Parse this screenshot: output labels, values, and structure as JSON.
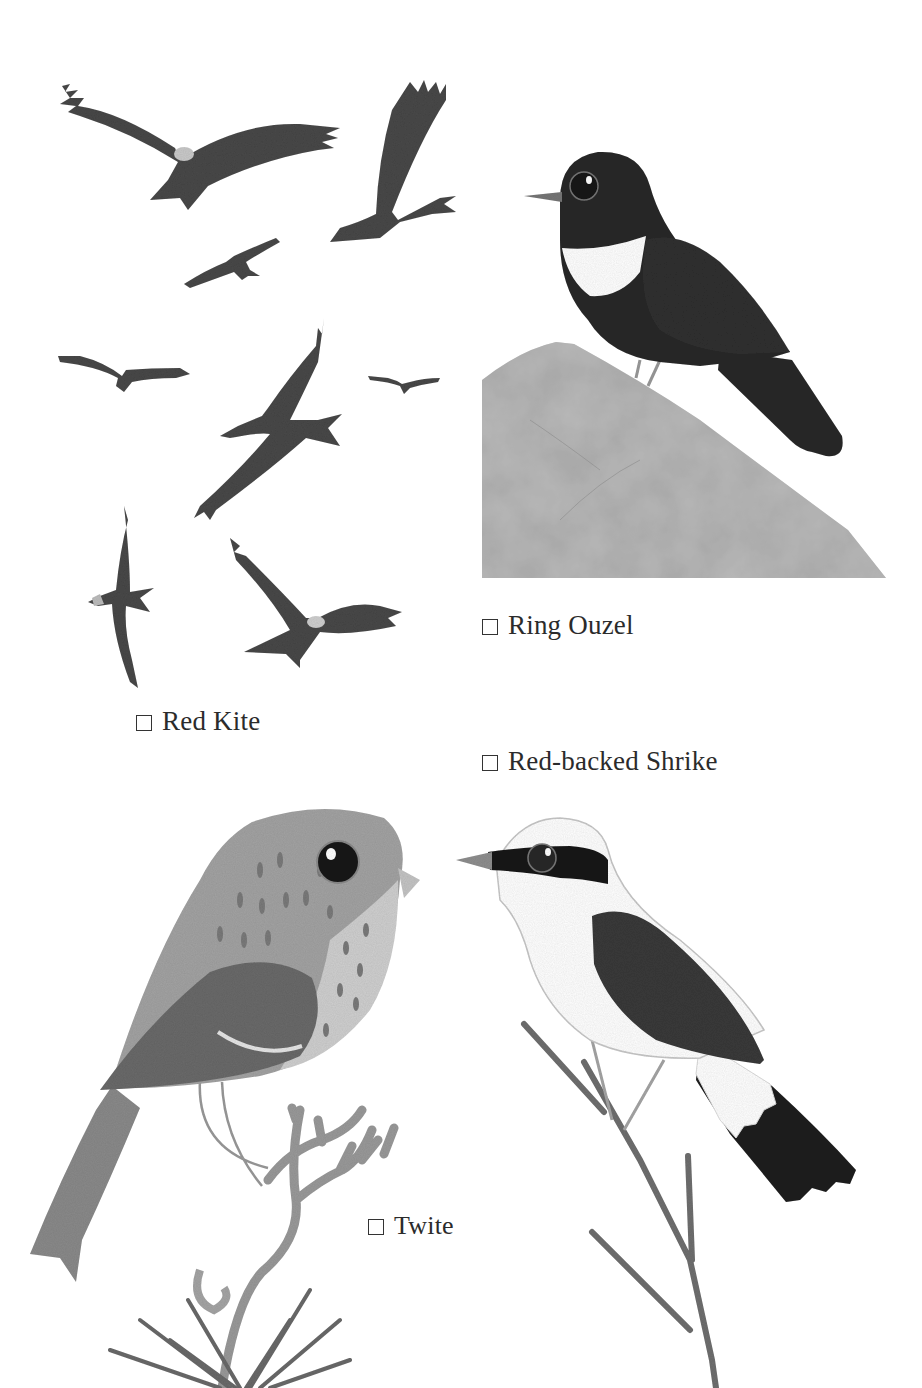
{
  "page": {
    "type": "bird spotting checklist illustration",
    "background_color": "#ffffff",
    "palette": {
      "kite_body": "#4a4a4a",
      "kite_head": "#c8c8c8",
      "ouzel_black": "#2a2a2a",
      "ouzel_collar": "#ffffff",
      "rock": "#a9a9a9",
      "twite_body": "#9a9a9a",
      "twite_wing": "#6b6b6b",
      "shrike_mask": "#1f1f1f",
      "shrike_wing": "#3a3a3a",
      "branch": "#8a8a8a"
    }
  },
  "checklist": [
    {
      "id": "ring-ouzel",
      "label": "Ring Ouzel",
      "checked": false,
      "checkbox_glyph": "☐"
    },
    {
      "id": "red-kite",
      "label": "Red Kite",
      "checked": false,
      "checkbox_glyph": "☐"
    },
    {
      "id": "red-backed-shrike",
      "label": "Red-backed Shrike",
      "checked": false,
      "checkbox_glyph": "☐"
    },
    {
      "id": "twite",
      "label": "Twite",
      "checked": false,
      "checkbox_glyph": "☐"
    }
  ],
  "illustrations": {
    "red_kite": {
      "subject": "flock of red kites in flight",
      "count": 9
    },
    "ring_ouzel": {
      "subject": "ring ouzel perched on a grey rock"
    },
    "red_backed_shrike": {
      "subject": "red-backed shrike perched on a thorny twig"
    },
    "twite": {
      "subject": "twite perched on a heather branch"
    }
  }
}
